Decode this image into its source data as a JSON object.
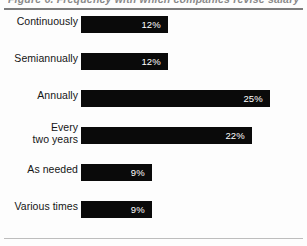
{
  "figure": {
    "title": "Figure 6.  Frequency with which companies revise salary structures",
    "rules": {
      "top": true,
      "bottom": true
    }
  },
  "chart_data": {
    "type": "bar",
    "orientation": "horizontal",
    "title": "Figure 6.  Frequency with which companies revise salary structures",
    "xlabel": "",
    "ylabel": "",
    "xlim": [
      0,
      30
    ],
    "grid": false,
    "legend": false,
    "value_suffix": "%",
    "bar_color": "#0a0a0a",
    "value_label_color": "#ffffff",
    "categories": [
      "Continuously",
      "Semiannually",
      "Annually",
      "Every two years",
      "As needed",
      "Various times"
    ],
    "values": [
      12,
      12,
      25,
      22,
      9,
      9
    ],
    "bars": [
      {
        "label": "Continuously",
        "label_lines": [
          "Continuously"
        ],
        "value": 12,
        "value_label": "12%",
        "bar_px": 87
      },
      {
        "label": "Semiannually",
        "label_lines": [
          "Semiannually"
        ],
        "value": 12,
        "value_label": "12%",
        "bar_px": 87
      },
      {
        "label": "Annually",
        "label_lines": [
          "Annually"
        ],
        "value": 25,
        "value_label": "25%",
        "bar_px": 189
      },
      {
        "label": "Every two years",
        "label_lines": [
          "Every",
          "two years"
        ],
        "value": 22,
        "value_label": "22%",
        "bar_px": 171
      },
      {
        "label": "As needed",
        "label_lines": [
          "As needed"
        ],
        "value": 9,
        "value_label": "9%",
        "bar_px": 71
      },
      {
        "label": "Various times",
        "label_lines": [
          "Various times"
        ],
        "value": 9,
        "value_label": "9%",
        "bar_px": 71
      }
    ]
  }
}
